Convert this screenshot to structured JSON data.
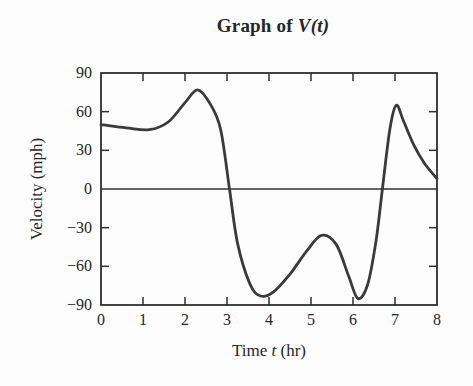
{
  "figure": {
    "background": "#fdfdfd",
    "ink_color": "#2f2f2f",
    "text_color": "#262626",
    "curve_color": "#3a3a3a"
  },
  "chart_data": {
    "type": "line",
    "title_prefix": "Graph of",
    "title_math": "V(t)",
    "xlabel": "Time t (hr)",
    "xlabel_pre": "Time",
    "xlabel_var": "t",
    "xlabel_post": "(hr)",
    "ylabel": "Velocity (mph)",
    "xlim": [
      0,
      8
    ],
    "ylim": [
      -90,
      90
    ],
    "x_ticks": [
      0,
      1,
      2,
      3,
      4,
      5,
      6,
      7,
      8
    ],
    "y_ticks": [
      90,
      60,
      30,
      0,
      -30,
      -60,
      -90
    ],
    "grid": false,
    "legend": "none",
    "series": [
      {
        "name": "V(t)",
        "points": [
          [
            0,
            50
          ],
          [
            0.6,
            47.5
          ],
          [
            1.15,
            46
          ],
          [
            1.6,
            52
          ],
          [
            2.0,
            67
          ],
          [
            2.3,
            77
          ],
          [
            2.6,
            66
          ],
          [
            2.85,
            46
          ],
          [
            3.06,
            0
          ],
          [
            3.25,
            -42
          ],
          [
            3.55,
            -74
          ],
          [
            3.8,
            -83
          ],
          [
            4.1,
            -80
          ],
          [
            4.5,
            -66
          ],
          [
            4.9,
            -48
          ],
          [
            5.25,
            -36
          ],
          [
            5.6,
            -43
          ],
          [
            5.9,
            -68
          ],
          [
            6.12,
            -85
          ],
          [
            6.35,
            -74
          ],
          [
            6.55,
            -40
          ],
          [
            6.7,
            0
          ],
          [
            6.88,
            47
          ],
          [
            7.03,
            65
          ],
          [
            7.2,
            53
          ],
          [
            7.45,
            34
          ],
          [
            7.7,
            20
          ],
          [
            8,
            8
          ]
        ]
      }
    ]
  }
}
